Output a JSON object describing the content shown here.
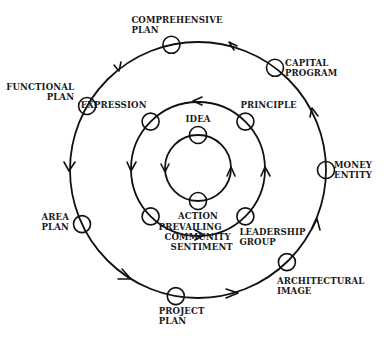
{
  "diagram": {
    "colors": {
      "stroke": "#111111",
      "background": "#ffffff",
      "text": "#1a1a1a"
    },
    "center": [
      198,
      170
    ],
    "rings": [
      {
        "name": "inner",
        "radius": 33,
        "direction": "counterclockwise",
        "nodes": [
          {
            "id": "idea",
            "label": [
              "IDEA"
            ],
            "angle": -90
          },
          {
            "id": "action",
            "label": [
              "ACTION"
            ],
            "angle": 90
          }
        ]
      },
      {
        "name": "middle",
        "radius": 67,
        "direction": "counterclockwise",
        "nodes": [
          {
            "id": "principle",
            "label": [
              "PRINCIPLE"
            ],
            "angle": -45
          },
          {
            "id": "expression",
            "label": [
              "EXPRESSION"
            ],
            "angle": -135
          },
          {
            "id": "prevailing-community-sentiment",
            "label": [
              "PREVAILING",
              "COMMUNITY",
              "SENTIMENT"
            ],
            "angle": 135
          },
          {
            "id": "leadership-group",
            "label": [
              "LEADERSHIP",
              "GROUP"
            ],
            "angle": 45
          }
        ]
      },
      {
        "name": "outer",
        "radius": 128,
        "direction": "counterclockwise",
        "nodes": [
          {
            "id": "comprehensive-plan",
            "label": [
              "COMPREHENSIVE",
              "PLAN"
            ],
            "angle": -102
          },
          {
            "id": "capital-program",
            "label": [
              "CAPITAL",
              "PROGRAM"
            ],
            "angle": -53
          },
          {
            "id": "money-entity",
            "label": [
              "MONEY",
              "ENTITY"
            ],
            "angle": 0
          },
          {
            "id": "architectural-image",
            "label": [
              "ARCHITECTURAL",
              "IMAGE"
            ],
            "angle": 46
          },
          {
            "id": "project-plan",
            "label": [
              "PROJECT",
              "PLAN"
            ],
            "angle": 100
          },
          {
            "id": "area-plan",
            "label": [
              "AREA",
              "PLAN"
            ],
            "angle": 155
          },
          {
            "id": "functional-plan",
            "label": [
              "FUNCTIONAL",
              "PLAN"
            ],
            "angle": -150
          }
        ]
      }
    ]
  }
}
